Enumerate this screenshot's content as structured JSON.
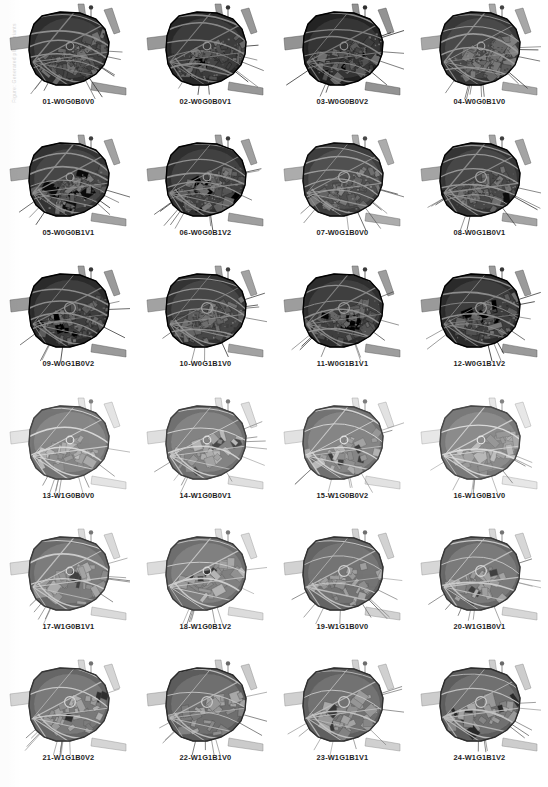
{
  "page": {
    "margin_note": "Figure: Generated plan variants",
    "columns": 4,
    "rows": 6,
    "total_variants": 24,
    "background_color": "#ffffff",
    "caption_color": "#1d1d1d"
  },
  "palette": {
    "land_dark": "#4a4a4a",
    "land_mid": "#6e6e6e",
    "land_light": "#9a9a9a",
    "block_fill": "#8c8c8c",
    "block_fill_light": "#b4b4b4",
    "block_dark": "#3a3a3a",
    "road": "#d6d6d6",
    "road_outer": "#8f8f8f",
    "hatch": "#2f2f2f",
    "outline": "#333333"
  },
  "legend_codes": {
    "W": "wall variant",
    "G": "green/open-space variant",
    "B": "block subdivision variant",
    "V": "void/courtyard variant"
  },
  "cells": [
    {
      "index": "01",
      "code": "W0G0B0V0",
      "label": "01-W0G0B0V0",
      "W": 0,
      "G": 0,
      "B": 0,
      "V": 0,
      "density": 0.92,
      "tone": 0.34,
      "seed": 11
    },
    {
      "index": "02",
      "code": "W0G0B0V1",
      "label": "02-W0G0B0V1",
      "W": 0,
      "G": 0,
      "B": 0,
      "V": 1,
      "density": 0.95,
      "tone": 0.32,
      "seed": 23
    },
    {
      "index": "03",
      "code": "W0G0B0V2",
      "label": "03-W0G0B0V2",
      "W": 0,
      "G": 0,
      "B": 0,
      "V": 2,
      "density": 0.9,
      "tone": 0.3,
      "seed": 37
    },
    {
      "index": "04",
      "code": "W0G0B1V0",
      "label": "04-W0G0B1V0",
      "W": 0,
      "G": 0,
      "B": 1,
      "V": 0,
      "density": 0.88,
      "tone": 0.38,
      "seed": 41
    },
    {
      "index": "05",
      "code": "W0G0B1V1",
      "label": "05-W0G0B1V1",
      "W": 0,
      "G": 0,
      "B": 1,
      "V": 1,
      "density": 0.86,
      "tone": 0.36,
      "seed": 53
    },
    {
      "index": "06",
      "code": "W0G0B1V2",
      "label": "06-W0G0B1V2",
      "W": 0,
      "G": 0,
      "B": 1,
      "V": 2,
      "density": 0.84,
      "tone": 0.35,
      "seed": 67
    },
    {
      "index": "07",
      "code": "W0G1B0V0",
      "label": "07-W0G1B0V0",
      "W": 0,
      "G": 1,
      "B": 0,
      "V": 0,
      "density": 0.8,
      "tone": 0.4,
      "seed": 71
    },
    {
      "index": "08",
      "code": "W0G1B0V1",
      "label": "08-W0G1B0V1",
      "W": 0,
      "G": 1,
      "B": 0,
      "V": 1,
      "density": 0.82,
      "tone": 0.37,
      "seed": 83
    },
    {
      "index": "09",
      "code": "W0G1B0V2",
      "label": "09-W0G1B0V2",
      "W": 0,
      "G": 1,
      "B": 0,
      "V": 2,
      "density": 0.83,
      "tone": 0.33,
      "seed": 97
    },
    {
      "index": "10",
      "code": "W0G1B1V0",
      "label": "10-W0G1B1V0",
      "W": 0,
      "G": 1,
      "B": 1,
      "V": 0,
      "density": 0.87,
      "tone": 0.36,
      "seed": 101
    },
    {
      "index": "11",
      "code": "W0G1B1V1",
      "label": "11-W0G1B1V1",
      "W": 0,
      "G": 1,
      "B": 1,
      "V": 1,
      "density": 0.85,
      "tone": 0.34,
      "seed": 113
    },
    {
      "index": "12",
      "code": "W0G1B1V2",
      "label": "12-W0G1B1V2",
      "W": 0,
      "G": 1,
      "B": 1,
      "V": 2,
      "density": 0.86,
      "tone": 0.33,
      "seed": 127
    },
    {
      "index": "13",
      "code": "W1G0B0V0",
      "label": "13-W1G0B0V0",
      "W": 1,
      "G": 0,
      "B": 0,
      "V": 0,
      "density": 0.45,
      "tone": 0.62,
      "seed": 131
    },
    {
      "index": "14",
      "code": "W1G0B0V1",
      "label": "14-W1G0B0V1",
      "W": 1,
      "G": 0,
      "B": 0,
      "V": 1,
      "density": 0.5,
      "tone": 0.6,
      "seed": 149
    },
    {
      "index": "15",
      "code": "W1G0B0V2",
      "label": "15-W1G0B0V2",
      "W": 1,
      "G": 0,
      "B": 0,
      "V": 2,
      "density": 0.52,
      "tone": 0.61,
      "seed": 151
    },
    {
      "index": "16",
      "code": "W1G0B1V0",
      "label": "16-W1G0B1V0",
      "W": 1,
      "G": 0,
      "B": 1,
      "V": 0,
      "density": 0.48,
      "tone": 0.63,
      "seed": 163
    },
    {
      "index": "17",
      "code": "W1G0B1V1",
      "label": "17-W1G0B1V1",
      "W": 1,
      "G": 0,
      "B": 1,
      "V": 1,
      "density": 0.55,
      "tone": 0.58,
      "seed": 173
    },
    {
      "index": "18",
      "code": "W1G0B1V2",
      "label": "18-W1G0B1V2",
      "W": 1,
      "G": 0,
      "B": 1,
      "V": 2,
      "density": 0.53,
      "tone": 0.59,
      "seed": 181
    },
    {
      "index": "19",
      "code": "W1G1B0V0",
      "label": "19-W1G1B0V0",
      "W": 1,
      "G": 1,
      "B": 0,
      "V": 0,
      "density": 0.58,
      "tone": 0.55,
      "seed": 191
    },
    {
      "index": "20",
      "code": "W1G1B0V1",
      "label": "20-W1G1B0V1",
      "W": 1,
      "G": 1,
      "B": 0,
      "V": 1,
      "density": 0.56,
      "tone": 0.57,
      "seed": 199
    },
    {
      "index": "21",
      "code": "W1G1B0V2",
      "label": "21-W1G1B0V2",
      "W": 1,
      "G": 1,
      "B": 0,
      "V": 2,
      "density": 0.57,
      "tone": 0.56,
      "seed": 211
    },
    {
      "index": "22",
      "code": "W1G1B1V0",
      "label": "22-W1G1B1V0",
      "W": 1,
      "G": 1,
      "B": 1,
      "V": 0,
      "density": 0.6,
      "tone": 0.52,
      "seed": 223
    },
    {
      "index": "23",
      "code": "W1G1B1V1",
      "label": "23-W1G1B1V1",
      "W": 1,
      "G": 1,
      "B": 1,
      "V": 1,
      "density": 0.59,
      "tone": 0.54,
      "seed": 227
    },
    {
      "index": "24",
      "code": "W1G1B1V2",
      "label": "24-W1G1B1V2",
      "W": 1,
      "G": 1,
      "B": 1,
      "V": 2,
      "density": 0.61,
      "tone": 0.53,
      "seed": 233
    }
  ]
}
